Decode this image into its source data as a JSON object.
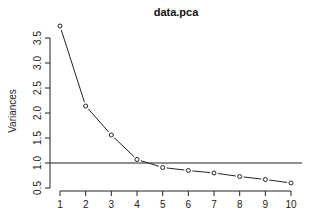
{
  "chart_data": {
    "type": "line",
    "title": "data.pca",
    "xlabel": "",
    "ylabel": "Variances",
    "x": [
      1,
      2,
      3,
      4,
      5,
      6,
      7,
      8,
      9,
      10
    ],
    "series": [
      {
        "name": "Variances",
        "values": [
          3.74,
          2.14,
          1.56,
          1.07,
          0.91,
          0.85,
          0.8,
          0.73,
          0.67,
          0.6
        ],
        "marker": "open-circle",
        "color": "#222222"
      }
    ],
    "reference_lines": [
      {
        "orientation": "horizontal",
        "y": 1.0,
        "color": "#222222"
      }
    ],
    "xticks": [
      "1",
      "2",
      "3",
      "4",
      "5",
      "6",
      "7",
      "8",
      "9",
      "10"
    ],
    "yticks": [
      "0.5",
      "1.0",
      "1.5",
      "2.0",
      "2.5",
      "3.0",
      "3.5"
    ],
    "ytick_values": [
      0.5,
      1.0,
      1.5,
      2.0,
      2.5,
      3.0,
      3.5
    ],
    "xlim": [
      1,
      10
    ],
    "ylim": [
      0.5,
      3.74
    ],
    "grid": false,
    "legend": null
  }
}
